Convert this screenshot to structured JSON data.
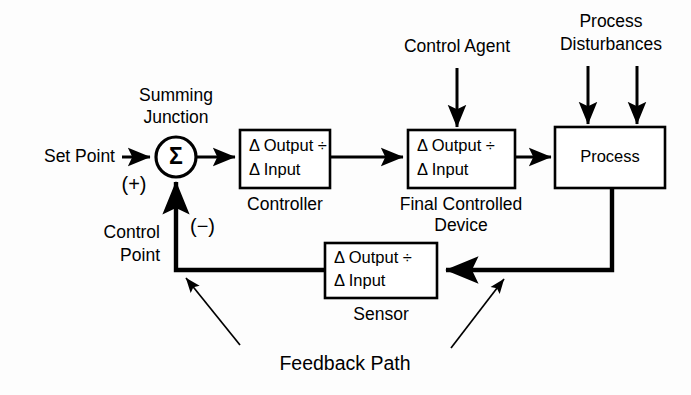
{
  "diagram": {
    "colors": {
      "background": "#fdfdfd",
      "stroke": "#000000",
      "box_fill": "#ffffff"
    },
    "labels": {
      "set_point": "Set Point",
      "summing_junction_line1": "Summing",
      "summing_junction_line2": "Junction",
      "sigma": "Σ",
      "plus_sign": "(+)",
      "minus_sign": "(−)",
      "control_point_line1": "Control",
      "control_point_line2": "Point",
      "control_agent": "Control Agent",
      "process_disturbances_line1": "Process",
      "process_disturbances_line2": "Disturbances",
      "feedback_path": "Feedback Path"
    },
    "blocks": [
      {
        "id": "controller",
        "line1": "Δ Output ÷",
        "line2": "Δ Input",
        "caption": "Controller",
        "caption_line2": ""
      },
      {
        "id": "final-controlled-device",
        "line1": "Δ Output ÷",
        "line2": "Δ Input",
        "caption": "Final Controlled",
        "caption_line2": "Device"
      },
      {
        "id": "process",
        "line1": "Process",
        "line2": "",
        "caption": "",
        "caption_line2": ""
      },
      {
        "id": "sensor",
        "line1": "Δ Output ÷",
        "line2": "Δ Input",
        "caption": "Sensor",
        "caption_line2": ""
      }
    ]
  }
}
